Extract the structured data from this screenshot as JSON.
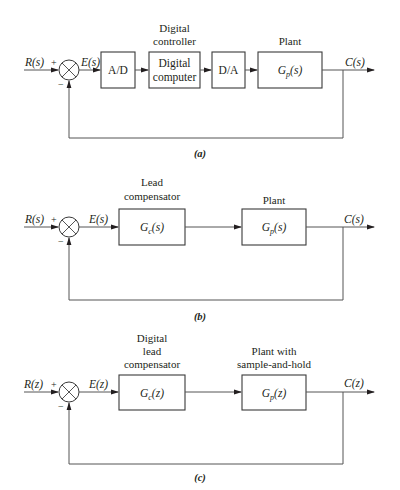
{
  "diagrams": [
    {
      "id": "a",
      "caption": "(a)",
      "input": "R(s)",
      "error": "E(s)",
      "output": "C(s)",
      "sum_plus": "+",
      "sum_minus": "−",
      "blocks": [
        {
          "label": "A/D",
          "caption_lines": []
        },
        {
          "label_lines": [
            "Digital",
            "computer"
          ],
          "caption_lines": [
            "Digital",
            "controller"
          ]
        },
        {
          "label": "D/A",
          "caption_lines": []
        },
        {
          "label": "Gp(s)",
          "label_main": "G",
          "label_sub": "p",
          "label_arg": "(s)",
          "caption_lines": [
            "Plant"
          ]
        }
      ]
    },
    {
      "id": "b",
      "caption": "(b)",
      "input": "R(s)",
      "error": "E(s)",
      "output": "C(s)",
      "sum_plus": "+",
      "sum_minus": "−",
      "blocks": [
        {
          "label": "Gc(s)",
          "label_main": "G",
          "label_sub": "c",
          "label_arg": "(s)",
          "caption_lines": [
            "Lead",
            "compensator"
          ]
        },
        {
          "label": "Gp(s)",
          "label_main": "G",
          "label_sub": "p",
          "label_arg": "(s)",
          "caption_lines": [
            "Plant"
          ]
        }
      ]
    },
    {
      "id": "c",
      "caption": "(c)",
      "input": "R(z)",
      "error": "E(z)",
      "output": "C(z)",
      "sum_plus": "+",
      "sum_minus": "−",
      "blocks": [
        {
          "label": "Gc(z)",
          "label_main": "G",
          "label_sub": "c",
          "label_arg": "(z)",
          "caption_lines": [
            "Digital",
            "lead",
            "compensator"
          ]
        },
        {
          "label": "Gp(z)",
          "label_main": "G",
          "label_sub": "p",
          "label_arg": "(z)",
          "caption_lines": [
            "Plant with",
            "sample-and-hold"
          ]
        }
      ]
    }
  ]
}
